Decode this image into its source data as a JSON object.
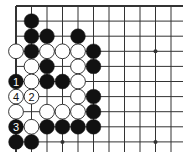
{
  "diagram": {
    "type": "go-board",
    "region": "top-left corner of 19x19 board",
    "grid": {
      "origin_x": 16,
      "origin_y": 6,
      "spacing_x": 15.5,
      "spacing_y": 15.1,
      "cols": 11,
      "rows": 10,
      "extend_right_to": 183,
      "extend_down_to": 152
    },
    "colors": {
      "line": "#333333",
      "black_stone": "#111111",
      "white_stone": "#ffffff",
      "stone_outline": "#222222",
      "background": "#ffffff"
    },
    "star_points": [
      {
        "col": 9,
        "row": 3
      },
      {
        "col": 3,
        "row": 9
      },
      {
        "col": 9,
        "row": 9
      }
    ],
    "stones": [
      {
        "col": 1,
        "row": 1,
        "color": "black"
      },
      {
        "col": 1,
        "row": 2,
        "color": "black"
      },
      {
        "col": 2,
        "row": 2,
        "color": "black"
      },
      {
        "col": 4,
        "row": 2,
        "color": "black"
      },
      {
        "col": 0,
        "row": 3,
        "color": "white"
      },
      {
        "col": 1,
        "row": 3,
        "color": "black"
      },
      {
        "col": 2,
        "row": 3,
        "color": "white"
      },
      {
        "col": 3,
        "row": 3,
        "color": "white"
      },
      {
        "col": 4,
        "row": 3,
        "color": "white"
      },
      {
        "col": 5,
        "row": 3,
        "color": "black"
      },
      {
        "col": 1,
        "row": 4,
        "color": "white"
      },
      {
        "col": 2,
        "row": 4,
        "color": "black"
      },
      {
        "col": 4,
        "row": 4,
        "color": "white"
      },
      {
        "col": 5,
        "row": 4,
        "color": "black"
      },
      {
        "col": 0,
        "row": 5,
        "color": "black",
        "label": "1"
      },
      {
        "col": 1,
        "row": 5,
        "color": "white"
      },
      {
        "col": 2,
        "row": 5,
        "color": "black"
      },
      {
        "col": 3,
        "row": 5,
        "color": "black"
      },
      {
        "col": 4,
        "row": 5,
        "color": "white"
      },
      {
        "col": 0,
        "row": 6,
        "color": "white",
        "label": "4"
      },
      {
        "col": 1,
        "row": 6,
        "color": "white",
        "label": "2"
      },
      {
        "col": 4,
        "row": 6,
        "color": "white"
      },
      {
        "col": 5,
        "row": 6,
        "color": "black"
      },
      {
        "col": 0,
        "row": 7,
        "color": "white"
      },
      {
        "col": 2,
        "row": 7,
        "color": "white"
      },
      {
        "col": 3,
        "row": 7,
        "color": "white"
      },
      {
        "col": 4,
        "row": 7,
        "color": "white"
      },
      {
        "col": 5,
        "row": 7,
        "color": "black"
      },
      {
        "col": 0,
        "row": 8,
        "color": "black",
        "label": "3"
      },
      {
        "col": 1,
        "row": 8,
        "color": "white"
      },
      {
        "col": 2,
        "row": 8,
        "color": "black"
      },
      {
        "col": 3,
        "row": 8,
        "color": "black"
      },
      {
        "col": 4,
        "row": 8,
        "color": "black"
      },
      {
        "col": 5,
        "row": 8,
        "color": "black"
      },
      {
        "col": 0,
        "row": 9,
        "color": "black"
      },
      {
        "col": 1,
        "row": 9,
        "color": "black"
      }
    ],
    "move_labels": [
      "1",
      "2",
      "3",
      "4"
    ]
  }
}
